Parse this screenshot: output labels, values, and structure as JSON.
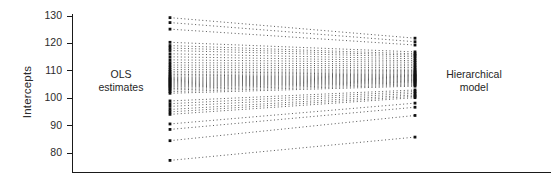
{
  "figure": {
    "background": "#ffffff",
    "ink_color": "#1a1a1a",
    "dot_color": "#555555"
  },
  "axis": {
    "y_label": "Intercepts",
    "tick_labels": [
      "130",
      "120",
      "110",
      "100",
      "90",
      "80"
    ],
    "tick_values": [
      130,
      120,
      110,
      100,
      90,
      80
    ]
  },
  "annotations": {
    "left": {
      "line1": "OLS",
      "line2": "estimates"
    },
    "right": {
      "line1": "Hierarchical",
      "line2": "model"
    }
  },
  "chart_data": {
    "type": "line",
    "title": "",
    "subtitle": "",
    "xlabel": "",
    "ylabel": "Intercepts",
    "xlim": [
      0,
      1
    ],
    "ylim": [
      76,
      132
    ],
    "grid": false,
    "legend": null,
    "x": [
      0,
      1
    ],
    "x_tick_labels": [
      "OLS estimates",
      "Hierarchical model"
    ],
    "y_ticks": [
      80,
      90,
      100,
      110,
      120,
      130
    ],
    "line_style": "dotted",
    "marker": "square",
    "series": [
      {
        "name": "group-01",
        "values": [
          129.4,
          121.9
        ]
      },
      {
        "name": "group-02",
        "values": [
          127.6,
          120.6
        ]
      },
      {
        "name": "group-03",
        "values": [
          125.2,
          119.4
        ]
      },
      {
        "name": "group-04",
        "values": [
          120.4,
          116.9
        ]
      },
      {
        "name": "group-05",
        "values": [
          119.2,
          116.2
        ]
      },
      {
        "name": "group-06",
        "values": [
          118.3,
          115.7
        ]
      },
      {
        "name": "group-07",
        "values": [
          117.4,
          115.1
        ]
      },
      {
        "name": "group-08",
        "values": [
          116.2,
          114.4
        ]
      },
      {
        "name": "group-09",
        "values": [
          115.1,
          113.7
        ]
      },
      {
        "name": "group-10",
        "values": [
          114.0,
          113.1
        ]
      },
      {
        "name": "group-11",
        "values": [
          113.0,
          112.4
        ]
      },
      {
        "name": "group-12",
        "values": [
          112.1,
          111.8
        ]
      },
      {
        "name": "group-13",
        "values": [
          111.3,
          111.2
        ]
      },
      {
        "name": "group-14",
        "values": [
          110.5,
          110.6
        ]
      },
      {
        "name": "group-15",
        "values": [
          109.8,
          110.1
        ]
      },
      {
        "name": "group-16",
        "values": [
          109.2,
          109.7
        ]
      },
      {
        "name": "group-17",
        "values": [
          108.6,
          109.3
        ]
      },
      {
        "name": "group-18",
        "values": [
          108.1,
          108.9
        ]
      },
      {
        "name": "group-19",
        "values": [
          107.6,
          108.6
        ]
      },
      {
        "name": "group-20",
        "values": [
          107.2,
          108.3
        ]
      },
      {
        "name": "group-21",
        "values": [
          106.8,
          108.0
        ]
      },
      {
        "name": "group-22",
        "values": [
          106.4,
          107.7
        ]
      },
      {
        "name": "group-23",
        "values": [
          106.0,
          107.4
        ]
      },
      {
        "name": "group-24",
        "values": [
          105.6,
          107.1
        ]
      },
      {
        "name": "group-25",
        "values": [
          105.2,
          106.8
        ]
      },
      {
        "name": "group-26",
        "values": [
          104.8,
          106.5
        ]
      },
      {
        "name": "group-27",
        "values": [
          104.4,
          106.2
        ]
      },
      {
        "name": "group-28",
        "values": [
          104.0,
          105.9
        ]
      },
      {
        "name": "group-29",
        "values": [
          103.5,
          105.6
        ]
      },
      {
        "name": "group-30",
        "values": [
          103.0,
          105.2
        ]
      },
      {
        "name": "group-31",
        "values": [
          102.4,
          104.8
        ]
      },
      {
        "name": "group-32",
        "values": [
          101.8,
          104.4
        ]
      },
      {
        "name": "group-33",
        "values": [
          99.0,
          103.0
        ]
      },
      {
        "name": "group-34",
        "values": [
          98.0,
          102.4
        ]
      },
      {
        "name": "group-35",
        "values": [
          97.0,
          101.8
        ]
      },
      {
        "name": "group-36",
        "values": [
          95.9,
          101.2
        ]
      },
      {
        "name": "group-37",
        "values": [
          95.0,
          100.7
        ]
      },
      {
        "name": "group-38",
        "values": [
          94.1,
          100.2
        ]
      },
      {
        "name": "group-39",
        "values": [
          90.6,
          98.2
        ]
      },
      {
        "name": "group-40",
        "values": [
          88.6,
          96.7
        ]
      },
      {
        "name": "group-41",
        "values": [
          84.5,
          93.7
        ]
      },
      {
        "name": "group-42",
        "values": [
          77.3,
          85.8
        ]
      }
    ]
  }
}
